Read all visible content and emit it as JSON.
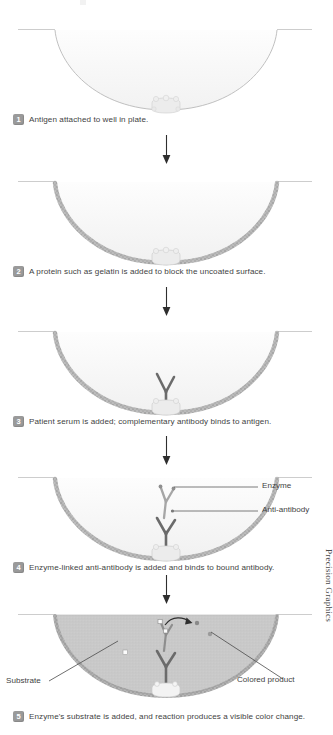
{
  "diagram": {
    "credit": "Precision Graphics",
    "colors": {
      "well_outline": "#b9b9b9",
      "well_fill": "#fbfbfb",
      "gelatin": "#b0b0b0",
      "antigen": "#e4e4e4",
      "antibody_dark": "#6f6f6f",
      "antibody_light": "#a9a9a9",
      "substrate_fill": "#c8c8c8",
      "badge": "#9a9a9a",
      "text": "#3f3f3f",
      "leader": "#5a5a5a"
    },
    "steps": [
      {
        "number": "1",
        "caption": "Antigen attached to well in plate.",
        "has_gelatin": false,
        "has_antibody": false,
        "has_anti_antibody": false,
        "filled": false,
        "labels": []
      },
      {
        "number": "2",
        "caption": "A protein such as gelatin is added to block the uncoated surface.",
        "has_gelatin": true,
        "has_antibody": false,
        "has_anti_antibody": false,
        "filled": false,
        "labels": []
      },
      {
        "number": "3",
        "caption": "Patient serum is added; complementary antibody binds to antigen.",
        "has_gelatin": true,
        "has_antibody": true,
        "has_anti_antibody": false,
        "filled": false,
        "labels": []
      },
      {
        "number": "4",
        "caption": "Enzyme-linked anti-antibody is added and binds to bound antibody.",
        "has_gelatin": true,
        "has_antibody": true,
        "has_anti_antibody": true,
        "filled": false,
        "labels": [
          "Enzyme",
          "Anti-antibody"
        ]
      },
      {
        "number": "5",
        "caption": "Enzyme's substrate is added, and reaction produces a visible color change.",
        "has_gelatin": true,
        "has_antibody": true,
        "has_anti_antibody": true,
        "filled": true,
        "labels": [
          "Substrate",
          "Colored product"
        ]
      }
    ],
    "callouts": {
      "enzyme": "Enzyme",
      "anti_antibody": "Anti-antibody",
      "substrate": "Substrate",
      "colored_product": "Colored product"
    },
    "arrow_count": 4
  }
}
